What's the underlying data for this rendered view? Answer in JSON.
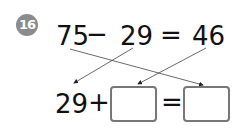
{
  "problem": {
    "number": "16",
    "top_equation": {
      "a": "75",
      "op": "−",
      "b": "29",
      "eq": "=",
      "result": "46"
    },
    "bottom_equation": {
      "a": "29",
      "op": "+",
      "blank1": "",
      "eq": "=",
      "blank2": ""
    }
  },
  "colors": {
    "badge": "#8c8c8c",
    "ink": "#111111",
    "box_border": "#777777"
  }
}
